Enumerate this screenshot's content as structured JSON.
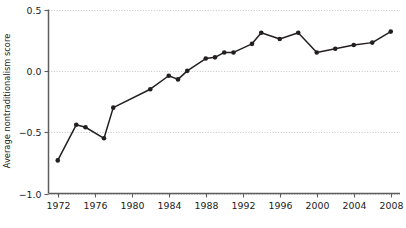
{
  "chart_data": {
    "type": "line",
    "title": "",
    "xlabel": "",
    "ylabel": "Average nontraditionalism score",
    "xlim": [
      1971,
      2009
    ],
    "ylim": [
      -1.0,
      0.5
    ],
    "grid": true,
    "legend": null,
    "xticks": [
      "1972",
      "1976",
      "1980",
      "1984",
      "1988",
      "1992",
      "1996",
      "2000",
      "2004",
      "2008"
    ],
    "xtick_values": [
      1972,
      1976,
      1980,
      1984,
      1988,
      1992,
      1996,
      2000,
      2004,
      2008
    ],
    "yticks": [
      "0.5",
      "0.0",
      "−0.5",
      "−1.0"
    ],
    "ytick_values": [
      0.5,
      0.0,
      -0.5,
      -1.0
    ],
    "x": [
      1972,
      1974,
      1975,
      1977,
      1978,
      1982,
      1984,
      1985,
      1986,
      1988,
      1989,
      1990,
      1991,
      1993,
      1994,
      1996,
      1998,
      2000,
      2002,
      2004,
      2006,
      2008
    ],
    "values": [
      -0.73,
      -0.44,
      -0.46,
      -0.55,
      -0.3,
      -0.15,
      -0.04,
      -0.07,
      0.0,
      0.1,
      0.11,
      0.15,
      0.15,
      0.22,
      0.31,
      0.26,
      0.31,
      0.15,
      0.18,
      0.21,
      0.23,
      0.32
    ],
    "series": [
      {
        "name": "Average nontraditionalism score",
        "x": [
          1972,
          1974,
          1975,
          1977,
          1978,
          1982,
          1984,
          1985,
          1986,
          1988,
          1989,
          1990,
          1991,
          1993,
          1994,
          1996,
          1998,
          2000,
          2002,
          2004,
          2006,
          2008
        ],
        "values": [
          -0.73,
          -0.44,
          -0.46,
          -0.55,
          -0.3,
          -0.15,
          -0.04,
          -0.07,
          0.0,
          0.1,
          0.11,
          0.15,
          0.15,
          0.22,
          0.31,
          0.26,
          0.31,
          0.15,
          0.18,
          0.21,
          0.23,
          0.32
        ],
        "color": "#231f20",
        "marker": "circle"
      }
    ],
    "colors": {
      "line": "#231f20",
      "marker": "#231f20",
      "grid": "#bdbdbd",
      "axis": "#5d5d5d",
      "text": "#1a1a1a",
      "background": "#ffffff"
    }
  }
}
